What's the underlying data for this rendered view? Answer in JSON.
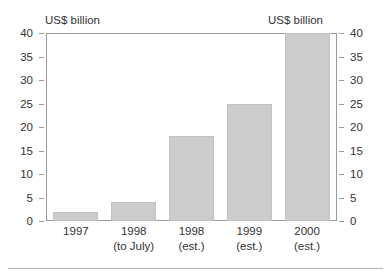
{
  "figure": {
    "clipped_title_text": "",
    "left_unit_caption": "US$ billion",
    "right_unit_caption": "US$ billion"
  },
  "chart_data": {
    "type": "bar",
    "title": "",
    "subtitle": "",
    "xlabel": "",
    "ylabel": "US$ billion",
    "ylabel_right": "US$ billion",
    "categories": [
      "1997",
      "1998 (to July)",
      "1998 (est.)",
      "1999 (est.)",
      "2000 (est.)"
    ],
    "category_lines": [
      {
        "line1": "1997",
        "line2": ""
      },
      {
        "line1": "1998",
        "line2": "(to July)"
      },
      {
        "line1": "1998",
        "line2": "(est.)"
      },
      {
        "line1": "1999",
        "line2": "(est.)"
      },
      {
        "line1": "2000",
        "line2": "(est.)"
      }
    ],
    "values": [
      2,
      4,
      18,
      25,
      40
    ],
    "ylim": [
      0,
      40
    ],
    "ytick_step": 5,
    "yticks": [
      40,
      35,
      30,
      25,
      20,
      15,
      10,
      5,
      0
    ],
    "yticks_right": [
      40,
      35,
      30,
      25,
      20,
      15,
      10,
      5,
      0
    ],
    "grid": false,
    "legend": false,
    "legend_position": "none",
    "bar_color": "#cccccc",
    "bar_edge_color": "#c2c2c2",
    "axis_color": "#9a9a9a",
    "text_color": "#333333",
    "background_color": "#ffffff",
    "dual_axis": true,
    "annotations": []
  }
}
